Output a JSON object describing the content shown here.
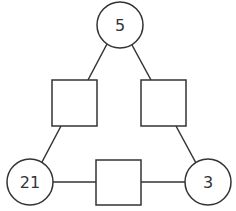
{
  "diagram": {
    "type": "number-triangle-puzzle",
    "circles": [
      {
        "id": "top",
        "label": "5",
        "cx": 120,
        "cy": 25,
        "r": 23
      },
      {
        "id": "bottom-left",
        "label": "21",
        "cx": 30,
        "cy": 182,
        "r": 23
      },
      {
        "id": "bottom-right",
        "label": "3",
        "cx": 208,
        "cy": 182,
        "r": 23
      }
    ],
    "boxes": [
      {
        "id": "left",
        "label": "",
        "x": 52,
        "y": 80,
        "w": 45,
        "h": 46
      },
      {
        "id": "right",
        "label": "",
        "x": 141,
        "y": 80,
        "w": 45,
        "h": 46
      },
      {
        "id": "bottom",
        "label": "",
        "x": 96,
        "y": 160,
        "w": 45,
        "h": 45
      }
    ],
    "stroke_color": "#333333",
    "fill_color": "#ffffff"
  }
}
